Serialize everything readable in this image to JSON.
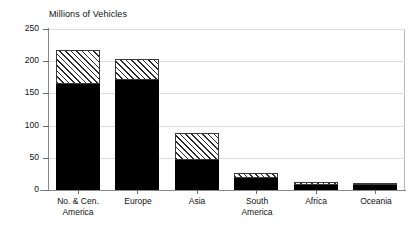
{
  "chart_data": {
    "type": "bar",
    "title": "Millions of Vehicles",
    "subtitle": "",
    "xlabel": "",
    "ylabel": "",
    "ylim": [
      0,
      250
    ],
    "yticks": [
      0,
      50,
      100,
      150,
      200,
      250
    ],
    "ytick_labels": [
      "0",
      "50",
      "100",
      "150",
      "200",
      "250"
    ],
    "grid": true,
    "grid_axis": "y",
    "legend": false,
    "legend_position": "none",
    "stacked": true,
    "categories": [
      "No. & Cen.\nAmerica",
      "Europe",
      "Asia",
      "South\nAmerica",
      "Africa",
      "Oceania"
    ],
    "series": [
      {
        "name": "Passenger cars",
        "style": "solid-black",
        "color": "#000000",
        "values": [
          164,
          171,
          47,
          18,
          8,
          8
        ]
      },
      {
        "name": "Commercial vehicles",
        "style": "diagonal-hatch",
        "color": "#ffffff",
        "values": [
          53,
          33,
          42,
          7,
          4,
          3
        ]
      }
    ],
    "totals": [
      217,
      204,
      89,
      25,
      12,
      11
    ]
  },
  "axis_colors": {
    "axis_line": "#8a8a8a",
    "gridline": "#dedede",
    "plot_border": "#b9b9b9",
    "text": "#111111"
  }
}
